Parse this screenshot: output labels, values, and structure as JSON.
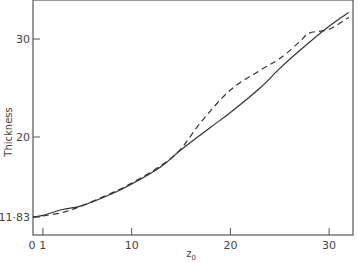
{
  "chart_data": {
    "type": "line",
    "title": "",
    "xlabel": "z0",
    "ylabel": "Thickness",
    "xlim": [
      0,
      32.5
    ],
    "ylim": [
      10.2,
      34
    ],
    "x_ticks": [
      0,
      1,
      10,
      20,
      30
    ],
    "x_tick_labels": [
      "0",
      "1",
      "10",
      "20",
      "30"
    ],
    "y_ticks": [
      11.83,
      20,
      30
    ],
    "y_tick_labels": [
      "11·83",
      "20",
      "30"
    ],
    "grid": false,
    "legend": null,
    "series": [
      {
        "name": "solid",
        "style": "solid",
        "x": [
          0,
          1,
          3,
          5,
          8,
          10,
          13,
          15,
          18,
          20,
          23,
          25,
          27,
          30,
          32
        ],
        "values": [
          11.83,
          12.0,
          12.6,
          13.0,
          14.2,
          15.2,
          17.0,
          18.7,
          21.0,
          22.5,
          25.0,
          27.0,
          28.8,
          31.3,
          32.7
        ]
      },
      {
        "name": "dashed",
        "style": "dashed",
        "x": [
          0,
          1,
          3,
          5,
          8,
          10,
          13,
          15,
          17,
          20,
          23,
          25,
          27,
          28,
          30,
          32
        ],
        "values": [
          11.83,
          11.95,
          12.3,
          13.0,
          14.3,
          15.3,
          17.1,
          18.8,
          21.5,
          24.8,
          26.8,
          28.0,
          29.7,
          30.6,
          31.0,
          32.2
        ]
      }
    ]
  },
  "labels": {
    "ylabel": "Thickness",
    "xlabel_main": "z",
    "xlabel_sub": "0"
  }
}
